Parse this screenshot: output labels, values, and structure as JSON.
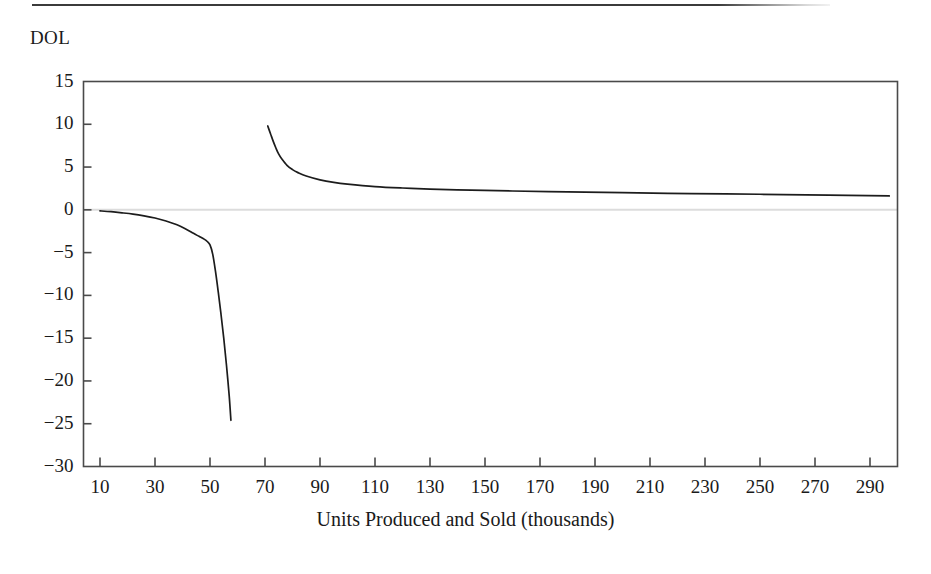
{
  "figure": {
    "y_axis_title": "DOL",
    "x_axis_title": "Units Produced and Sold (thousands)",
    "line_color": "#1c1c1c",
    "axis_color": "#4a4a4a",
    "zero_line_color": "#dcdcdc",
    "background_color": "#ffffff"
  },
  "chart_data": {
    "type": "line",
    "title": "",
    "xlabel": "Units Produced and Sold (thousands)",
    "ylabel": "DOL",
    "xlim": [
      4,
      300
    ],
    "ylim": [
      -30,
      15
    ],
    "grid": false,
    "legend": "none",
    "y_ticks": [
      15,
      10,
      5,
      0,
      -5,
      -10,
      -15,
      -20,
      -25,
      -30
    ],
    "y_tick_labels": [
      "15",
      "10",
      "5",
      "0",
      "−5",
      "−10",
      "−15",
      "−20",
      "−25",
      "−30"
    ],
    "x_ticks": [
      10,
      30,
      50,
      70,
      90,
      110,
      130,
      150,
      170,
      190,
      210,
      230,
      250,
      270,
      290
    ],
    "x_tick_labels": [
      "10",
      "30",
      "50",
      "70",
      "90",
      "110",
      "130",
      "150",
      "170",
      "190",
      "210",
      "230",
      "250",
      "270",
      "290"
    ],
    "zero_reference_line": 0,
    "annotations": [],
    "series": [
      {
        "name": "DOL below break-even",
        "x": [
          10,
          14,
          18,
          22,
          26,
          30,
          34,
          38,
          41,
          44,
          46,
          48,
          49,
          50,
          51,
          52,
          53,
          54,
          55,
          56,
          57,
          57.6
        ],
        "y": [
          -0.12,
          -0.22,
          -0.35,
          -0.5,
          -0.7,
          -0.95,
          -1.3,
          -1.75,
          -2.2,
          -2.75,
          -3.1,
          -3.45,
          -3.7,
          -4.1,
          -5.2,
          -7.2,
          -9.6,
          -12.2,
          -15.0,
          -18.2,
          -21.8,
          -24.6
        ]
      },
      {
        "name": "DOL above break-even",
        "x": [
          71,
          72,
          73,
          74,
          75,
          76,
          78,
          80,
          82,
          85,
          90,
          95,
          100,
          110,
          120,
          130,
          145,
          160,
          180,
          200,
          225,
          250,
          275,
          297
        ],
        "y": [
          9.8,
          8.9,
          8.0,
          7.2,
          6.5,
          6.0,
          5.2,
          4.7,
          4.35,
          3.95,
          3.5,
          3.2,
          3.0,
          2.72,
          2.55,
          2.43,
          2.3,
          2.2,
          2.1,
          2.0,
          1.9,
          1.82,
          1.72,
          1.62
        ]
      }
    ]
  }
}
